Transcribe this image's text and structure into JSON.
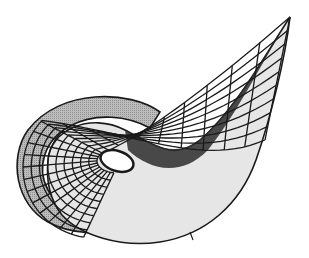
{
  "figure": {
    "background": "#ffffff",
    "colors": {
      "line": "#1a1a1a",
      "fill_light": "#e6e6e6",
      "fill_mid": "#bdbdbd",
      "fill_dark": "#8c8c8c",
      "hole": "#ffffff"
    },
    "regions": {
      "outer_loop": {
        "cx": 88,
        "cy": 168,
        "rx": 73,
        "ry": 72
      },
      "inner_hole": {
        "cx": 117,
        "cy": 161,
        "rx": 17,
        "ry": 10
      },
      "tail_tip": {
        "x": 290,
        "y": 17
      },
      "grid": {
        "u_lines": 22,
        "v_lines": 9
      }
    }
  }
}
